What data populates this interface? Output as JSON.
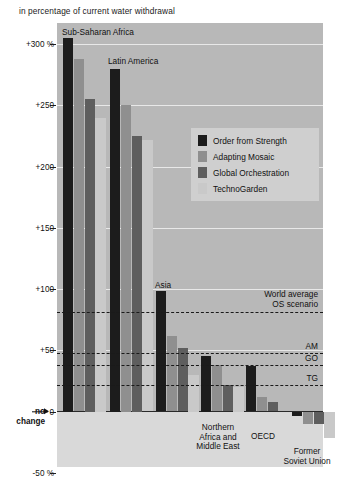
{
  "subtitle": "in percentage of current water withdrawal",
  "legend": {
    "items": [
      {
        "label": "Order from Strength",
        "color": "#1c1c1c"
      },
      {
        "label": "Adapting Mosaic",
        "color": "#8f8f8f"
      },
      {
        "label": "Global Orchestration",
        "color": "#5e5e5e"
      },
      {
        "label": "TechnoGarden",
        "color": "#c9c9c9"
      }
    ]
  },
  "axis": {
    "yticks": [
      "+300 %",
      "+250",
      "+200",
      "+150",
      "+100",
      "+50",
      "0",
      "-50 %"
    ],
    "ytick_values": [
      300,
      250,
      200,
      150,
      100,
      50,
      0,
      -50
    ],
    "nochange_line1": "no",
    "nochange_line2": "change"
  },
  "world_average": {
    "heading_line1": "World average",
    "heading_line2": "OS scenario",
    "lines": [
      {
        "key": "OS",
        "label": "",
        "value": 81
      },
      {
        "key": "AM",
        "label": "AM",
        "value": 48
      },
      {
        "key": "GO",
        "label": "GO",
        "value": 38
      },
      {
        "key": "TG",
        "label": "TG",
        "value": 22
      }
    ]
  },
  "chart_data": {
    "type": "bar",
    "title": "",
    "subtitle": "in percentage of current water withdrawal",
    "xlabel": "",
    "ylabel": "",
    "ylim": [
      -50,
      320
    ],
    "yticks": [
      -50,
      0,
      50,
      100,
      150,
      200,
      250,
      300
    ],
    "grid": true,
    "legend_position": "inside-right",
    "categories": [
      "Sub-Saharan Africa",
      "Latin America",
      "Asia",
      "Northern Africa and Middle East",
      "OECD",
      "Former Soviet Union"
    ],
    "category_labels": [
      [
        "Sub-Saharan Africa"
      ],
      [
        "Latin America"
      ],
      [
        "Asia"
      ],
      [
        "Northern",
        "Africa and",
        "Middle East"
      ],
      [
        "OECD"
      ],
      [
        "Former",
        "Soviet Union"
      ]
    ],
    "series": [
      {
        "name": "Order from Strength",
        "color": "#1c1c1c",
        "values": [
          305,
          280,
          98,
          45,
          37,
          -4
        ]
      },
      {
        "name": "Adapting Mosaic",
        "color": "#8f8f8f",
        "values": [
          288,
          250,
          62,
          38,
          12,
          -10
        ]
      },
      {
        "name": "Global Orchestration",
        "color": "#5e5e5e",
        "values": [
          255,
          225,
          52,
          22,
          8,
          -10
        ]
      },
      {
        "name": "TechnoGarden",
        "color": "#c9c9c9",
        "values": [
          240,
          222,
          30,
          20,
          0,
          -22
        ]
      }
    ],
    "annotations": [
      {
        "text": "World average OS scenario",
        "value": 81
      },
      {
        "text": "AM",
        "value": 48
      },
      {
        "text": "GO",
        "value": 38
      },
      {
        "text": "TG",
        "value": 22
      }
    ]
  }
}
